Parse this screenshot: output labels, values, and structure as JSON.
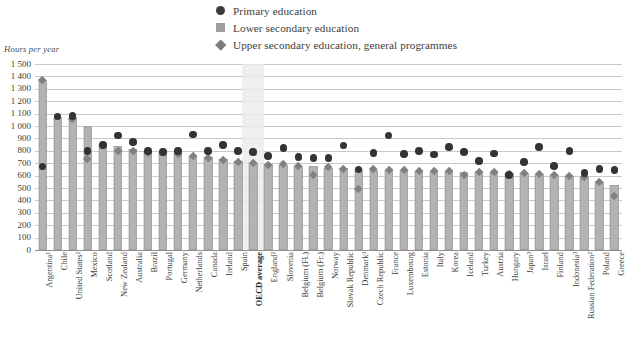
{
  "legend": {
    "items": [
      {
        "label": "Primary education",
        "marker": "circle-marker",
        "color": "#3b3b3b"
      },
      {
        "label": "Lower secondary education",
        "marker": "square-marker",
        "color": "#9e9e9e"
      },
      {
        "label": "Upper secondary education, general programmes",
        "marker": "diamond-marker",
        "color": "#7d7d7d"
      }
    ]
  },
  "chart_data": {
    "type": "bar",
    "title": "",
    "xlabel": "",
    "ylabel": "Hours per year",
    "ylim": [
      0,
      1500
    ],
    "ytick_step": 100,
    "yticks": [
      "0",
      "100",
      "200",
      "300",
      "400",
      "500",
      "600",
      "700",
      "800",
      "900",
      "1 000",
      "1 100",
      "1 200",
      "1 300",
      "1 400",
      "1 500"
    ],
    "grid": true,
    "legend_position": "top-right",
    "highlight_category": "OECD average",
    "highlight_color": "#ececec",
    "categories": [
      "Argentina¹",
      "Chile",
      "United States²",
      "Mexico",
      "Scotland",
      "New Zealand",
      "Australia",
      "Brazil",
      "Portugal",
      "Germany",
      "Netherlands",
      "Canada",
      "Ireland",
      "Spain",
      "OECD average",
      "England²",
      "Slovenia",
      "Belgium (Fl.)",
      "Belgium (Fr.)",
      "Norway",
      "Slovak Republic",
      "Denmark³",
      "Czech Republic",
      "France",
      "Luxembourg",
      "Estonia",
      "Italy",
      "Korea",
      "Iceland",
      "Turkey",
      "Austria",
      "Hungary",
      "Japan³",
      "Israel",
      "Finland",
      "Indonesia³",
      "Russian Federation²",
      "Poland",
      "Greece"
    ],
    "series": [
      {
        "name": "Lower secondary education",
        "marker": "bar",
        "values": [
          1368,
          1076,
          1076,
          1000,
          855,
          840,
          812,
          800,
          787,
          780,
          760,
          750,
          735,
          715,
          700,
          692,
          685,
          680,
          675,
          662,
          660,
          650,
          648,
          645,
          642,
          640,
          638,
          635,
          632,
          630,
          628,
          620,
          618,
          610,
          608,
          600,
          590,
          545,
          525
        ]
      },
      {
        "name": "Primary education",
        "marker": "circle",
        "values": [
          675,
          1076,
          1082,
          800,
          848,
          923,
          870,
          800,
          790,
          800,
          930,
          798,
          845,
          800,
          790,
          760,
          824,
          750,
          740,
          741,
          842,
          650,
          780,
          924,
          774,
          800,
          770,
          830,
          792,
          720,
          779,
          604,
          709,
          830,
          677,
          800,
          622,
          655,
          646
        ]
      },
      {
        "name": "Upper secondary education, general programmes",
        "marker": "diamond",
        "values": [
          1368,
          null,
          1055,
          732,
          null,
          800,
          798,
          782,
          790,
          770,
          758,
          742,
          722,
          710,
          700,
          680,
          690,
          676,
          605,
          670,
          650,
          493,
          648,
          645,
          640,
          638,
          636,
          635,
          600,
          628,
          627,
          615,
          617,
          608,
          603,
          598,
          588,
          544,
          438
        ]
      }
    ]
  }
}
